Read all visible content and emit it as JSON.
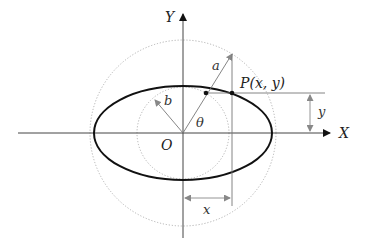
{
  "diagram": {
    "labels": {
      "y_axis": "Y",
      "x_axis": "X",
      "origin": "O",
      "semi_major": "a",
      "semi_minor": "b",
      "angle": "θ",
      "point": "P(x, y)",
      "x_dim": "x",
      "y_dim": "y"
    },
    "shapes": {
      "ellipse": "ellipse with semi-axes a and b",
      "outer_circle": "auxiliary circle of radius a (dotted)",
      "inner_circle": "auxiliary circle of radius b (dotted)"
    },
    "colors": {
      "ellipse": "#111111",
      "axes": "#444444",
      "guides": "#888888",
      "dotted": "#999999"
    }
  }
}
